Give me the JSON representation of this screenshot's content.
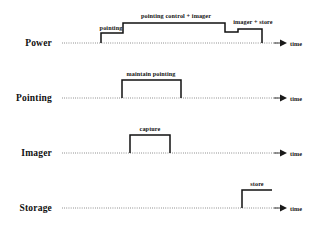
{
  "diagram": {
    "type": "timing-diagram",
    "axis_label": "time",
    "colors": {
      "waveform": "#111111",
      "baseline": "#3a3a3a",
      "background": "#ffffff",
      "text": "#111111"
    },
    "geometry": {
      "width": 309,
      "height": 229,
      "axis_start_x": 62,
      "axis_end_x": 278,
      "arrow_tip_x": 287
    },
    "rows": [
      {
        "id": "power",
        "label": "Power",
        "label_x": 52,
        "label_y": 43,
        "baseline_y": 43,
        "axis_label": "time",
        "axis_label_x": 290,
        "waveform_path": "M 101,43 L 101,33 L 123,33 L 123,23 L 225,23 L 225,32 L 238,32 L 238,29 L 262,29 L 262,43",
        "annotations": [
          {
            "id": "pointing",
            "text": "pointing",
            "x": 111,
            "y": 30
          },
          {
            "id": "pointing-control-imager",
            "text": "pointing control + imager",
            "x": 176,
            "y": 18
          },
          {
            "id": "imager-store",
            "text": "imager + store",
            "x": 253,
            "y": 24
          }
        ]
      },
      {
        "id": "pointing",
        "label": "Pointing",
        "label_x": 52,
        "label_y": 98,
        "baseline_y": 98,
        "axis_label": "time",
        "axis_label_x": 290,
        "waveform_path": "M 122,98 L 122,80 L 181,80 L 181,98",
        "annotations": [
          {
            "id": "maintain-pointing",
            "text": "maintain pointing",
            "x": 151,
            "y": 76
          }
        ]
      },
      {
        "id": "imager",
        "label": "Imager",
        "label_x": 52,
        "label_y": 153,
        "baseline_y": 153,
        "axis_label": "time",
        "axis_label_x": 290,
        "waveform_path": "M 130,153 L 130,135 L 170,135 L 170,153",
        "annotations": [
          {
            "id": "capture",
            "text": "capture",
            "x": 150,
            "y": 131
          }
        ]
      },
      {
        "id": "storage",
        "label": "Storage",
        "label_x": 52,
        "label_y": 208,
        "baseline_y": 208,
        "axis_label": "time",
        "axis_label_x": 290,
        "waveform_path": "M 242,208 L 242,190 L 272,190",
        "annotations": [
          {
            "id": "store",
            "text": "store",
            "x": 257,
            "y": 186
          }
        ]
      }
    ]
  }
}
